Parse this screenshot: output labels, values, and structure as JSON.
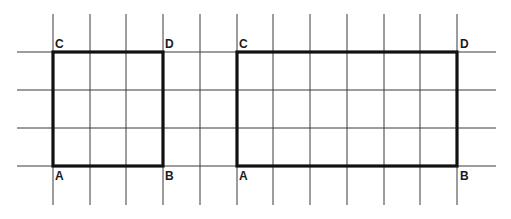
{
  "diagram": {
    "colors": {
      "grid": "#3a3a3a",
      "outline": "#111111",
      "label": "#1a1a1a",
      "background": "#ffffff"
    },
    "grid": {
      "vertical_x": [
        53,
        90,
        126,
        163,
        200,
        237,
        273,
        310,
        347,
        384,
        420,
        457
      ],
      "vertical_y_range": [
        14,
        205
      ],
      "horizontal_y": [
        52,
        90,
        128,
        166
      ],
      "horizontal_x_range": [
        17,
        496
      ]
    },
    "shapes": [
      {
        "name": "square",
        "width_units": 3,
        "height_units": 3,
        "x": 53,
        "y": 52,
        "w": 110,
        "h": 114,
        "labels": [
          {
            "text": "C",
            "x": 55,
            "y": 48
          },
          {
            "text": "D",
            "x": 165,
            "y": 48
          },
          {
            "text": "A",
            "x": 55,
            "y": 180
          },
          {
            "text": "B",
            "x": 165,
            "y": 180
          }
        ]
      },
      {
        "name": "rectangle",
        "width_units": 6,
        "height_units": 3,
        "x": 237,
        "y": 52,
        "w": 220,
        "h": 114,
        "labels": [
          {
            "text": "C",
            "x": 239,
            "y": 48
          },
          {
            "text": "D",
            "x": 460,
            "y": 48
          },
          {
            "text": "A",
            "x": 239,
            "y": 180
          },
          {
            "text": "B",
            "x": 460,
            "y": 180
          }
        ]
      }
    ]
  }
}
